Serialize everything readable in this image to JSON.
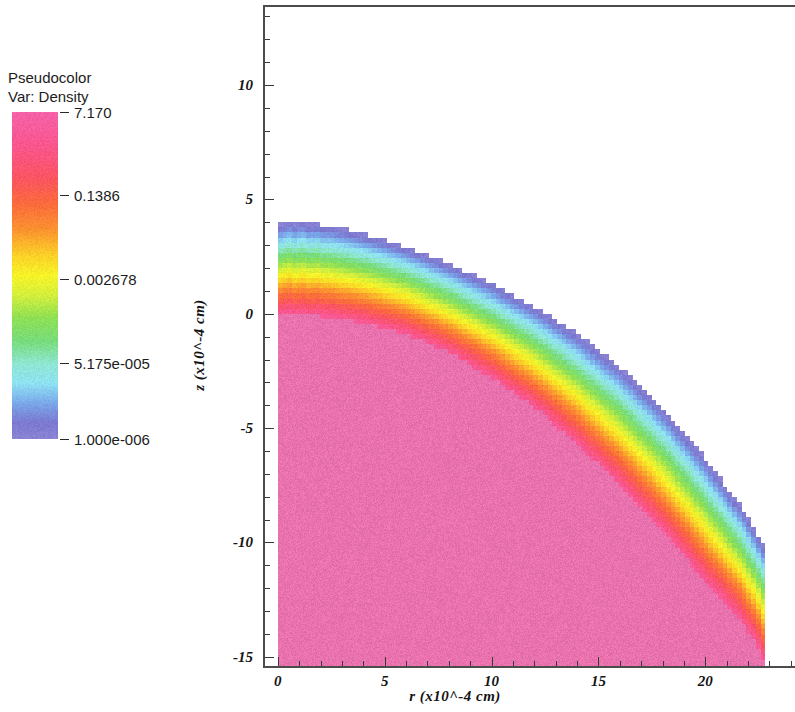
{
  "legend": {
    "title_line1": "Pseudocolor",
    "title_line2": "Var: Density",
    "ticks": [
      {
        "label": "7.170",
        "value": 7.17,
        "pos": 0.0
      },
      {
        "label": "0.1386",
        "value": 0.1386,
        "pos": 0.256
      },
      {
        "label": "0.002678",
        "value": 0.002678,
        "pos": 0.512
      },
      {
        "label": "5.175e-005",
        "value": 5.175e-05,
        "pos": 0.768
      },
      {
        "label": "1.000e-006",
        "value": 1e-06,
        "pos": 1.0
      }
    ],
    "colorbar_stops": [
      {
        "pos": 0.0,
        "color": "#f562a8"
      },
      {
        "pos": 0.1,
        "color": "#f9568f"
      },
      {
        "pos": 0.2,
        "color": "#fb5463"
      },
      {
        "pos": 0.28,
        "color": "#fb6a3c"
      },
      {
        "pos": 0.36,
        "color": "#fb9230"
      },
      {
        "pos": 0.44,
        "color": "#fbd227"
      },
      {
        "pos": 0.5,
        "color": "#f6f328"
      },
      {
        "pos": 0.56,
        "color": "#d4ef3c"
      },
      {
        "pos": 0.63,
        "color": "#8fe055"
      },
      {
        "pos": 0.7,
        "color": "#77dc7a"
      },
      {
        "pos": 0.77,
        "color": "#8fe6d2"
      },
      {
        "pos": 0.83,
        "color": "#8fe2f2"
      },
      {
        "pos": 0.89,
        "color": "#7aa8ea"
      },
      {
        "pos": 0.95,
        "color": "#7b78d0"
      },
      {
        "pos": 1.0,
        "color": "#8b84d4"
      }
    ]
  },
  "chart_data": {
    "type": "heatmap",
    "title": "",
    "variable": "Density",
    "render_style": "pseudocolor",
    "xlabel": "r (x10^-4 cm)",
    "ylabel": "z (x10^-4 cm)",
    "xlim": [
      -0.6,
      24.2
    ],
    "ylim": [
      -15.4,
      13.5
    ],
    "xticks": [
      0,
      5,
      10,
      15,
      20
    ],
    "yticks": [
      10,
      5,
      0,
      -5,
      -10,
      -15
    ],
    "x_minor_per_major": 5,
    "y_minor_per_major": 5,
    "grid": false,
    "colorbar_scale": "log",
    "colorbar_range": [
      1e-06,
      7.17
    ],
    "core_boundary": {
      "comment": "Outer edge of the dense pink core, sampled as (r, z) pairs in units of 1e-4 cm",
      "r": [
        0.0,
        2.0,
        4.0,
        6.0,
        8.0,
        10.0,
        12.0,
        14.0,
        16.0,
        18.0,
        20.0,
        21.5,
        22.4,
        22.7
      ],
      "z": [
        0.0,
        -0.1,
        -0.4,
        -0.9,
        -1.7,
        -2.8,
        -4.1,
        -5.7,
        -7.5,
        -9.5,
        -11.7,
        -13.2,
        -14.4,
        -15.2
      ]
    },
    "corona_outer_boundary": {
      "comment": "Outermost blue contour of the low-density halo, (r, z) pairs",
      "r": [
        0.0,
        1.0,
        2.0,
        3.0,
        4.5,
        6.0,
        8.0,
        10.0,
        12.0,
        14.0,
        16.0,
        18.0,
        20.0,
        21.8,
        22.9
      ],
      "z": [
        3.95,
        4.0,
        3.9,
        3.75,
        3.4,
        2.95,
        2.2,
        1.35,
        0.35,
        -0.85,
        -2.3,
        -4.1,
        -6.3,
        -8.6,
        -10.4
      ]
    },
    "bands": [
      {
        "name": "core",
        "color": "#ea72ae",
        "density_label": "7.170"
      },
      {
        "name": "red",
        "color": "#fb4a3e",
        "density_label": "~0.5"
      },
      {
        "name": "orange",
        "color": "#fb9a2e",
        "density_label": "~0.1386"
      },
      {
        "name": "yellow",
        "color": "#f6f328",
        "density_label": "~0.01"
      },
      {
        "name": "green",
        "color": "#7fe05e",
        "density_label": "~0.002678"
      },
      {
        "name": "cyan",
        "color": "#8fe4f0",
        "density_label": "~0.0003"
      },
      {
        "name": "blue",
        "color": "#6f6ccb",
        "density_label": "5.175e-005"
      }
    ]
  },
  "axes": {
    "x_title": "r (x10^-4 cm)",
    "y_title": "z (x10^-4 cm)",
    "x_tick_labels": [
      "0",
      "5",
      "10",
      "15",
      "20"
    ],
    "y_tick_labels": [
      "10",
      "5",
      "0",
      "-5",
      "-10",
      "-15"
    ]
  }
}
